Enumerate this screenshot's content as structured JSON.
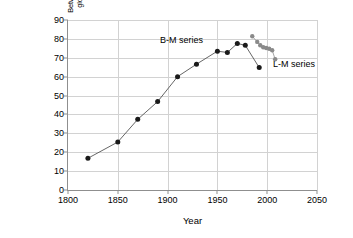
{
  "chart_data": {
    "type": "line",
    "title": "",
    "xlabel": "Year",
    "ylabel": "Between-country component of global inequality (in percent)",
    "ylabel_line1": "Between-country component of",
    "ylabel_line2": "global inequality (in percent)",
    "xlim": [
      1800,
      2050
    ],
    "ylim": [
      0,
      90
    ],
    "xticks": [
      1800,
      1850,
      1900,
      1950,
      2000,
      2050
    ],
    "yticks": [
      0,
      10,
      20,
      30,
      40,
      50,
      60,
      70,
      80,
      90
    ],
    "grid": true,
    "legend_position": "inline-annotations",
    "series": [
      {
        "name": "B-M series",
        "color": "#1a1a1a",
        "marker": "circle",
        "x": [
          1820,
          1850,
          1870,
          1890,
          1910,
          1929,
          1950,
          1960,
          1970,
          1978,
          1992
        ],
        "values": [
          16.8,
          25.4,
          37.4,
          46.8,
          60.0,
          66.6,
          73.5,
          72.8,
          77.6,
          76.6,
          64.8
        ]
      },
      {
        "name": "L-M series",
        "color": "#8a8a8a",
        "marker": "circle",
        "x": [
          1985,
          1990,
          1993,
          1996,
          1999,
          2002,
          2005,
          2008
        ],
        "values": [
          81.4,
          78.4,
          76.6,
          75.6,
          75.2,
          74.8,
          74.0,
          69.2
        ]
      }
    ],
    "annotations": [
      {
        "text": "B-M series",
        "x": 1882,
        "y": 79
      },
      {
        "text": "L-M series",
        "x": 2000,
        "y": 66
      }
    ]
  },
  "axis": {
    "x_title": "Year",
    "y_title_line1": "Between-country component of",
    "y_title_line2": "global inequality (in percent)"
  },
  "colors": {
    "background": "#ffffff",
    "grid": "#d2d2d2",
    "axis": "#8f8f8f",
    "series_bm": "#1a1a1a",
    "series_lm": "#8a8a8a",
    "text": "#000000"
  }
}
